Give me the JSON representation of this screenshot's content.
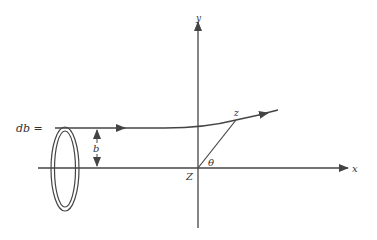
{
  "diagram": {
    "labels": {
      "y_axis": "y",
      "x_axis": "x",
      "origin": "Z",
      "point": "z",
      "angle": "θ",
      "impact_parameter": "b",
      "ring_width": "db ="
    },
    "colors": {
      "line": "#444444",
      "background": "#ffffff"
    }
  }
}
